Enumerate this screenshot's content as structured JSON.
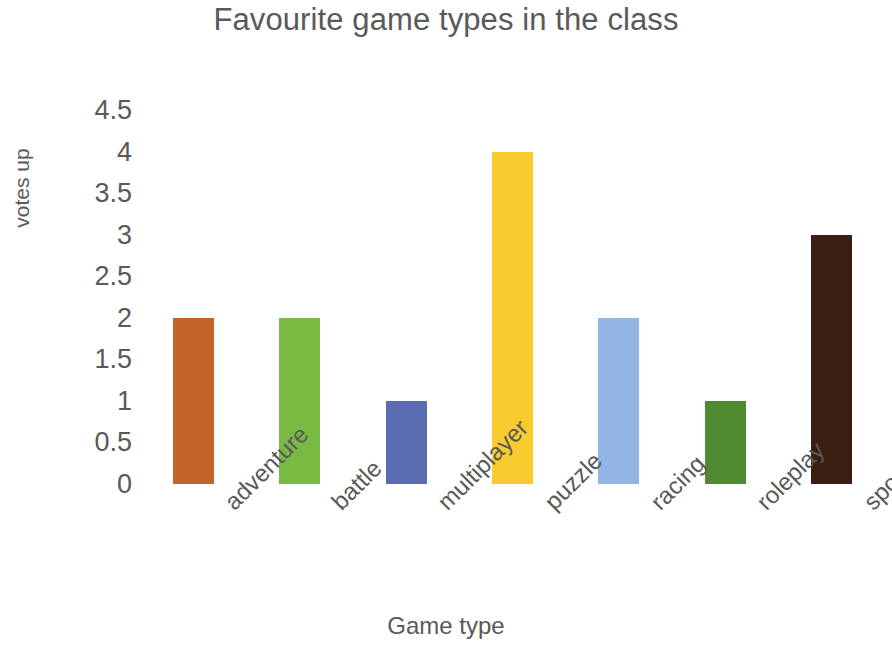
{
  "chart_data": {
    "type": "bar",
    "title": "Favourite game types in the class",
    "xlabel": "Game type",
    "ylabel": "votes up",
    "categories": [
      "adventure",
      "battle",
      "multiplayer",
      "puzzle",
      "racing",
      "roleplay",
      "sports"
    ],
    "values": [
      2,
      2,
      1,
      4,
      2,
      1,
      3
    ],
    "colors": [
      "#C4642A",
      "#79BB42",
      "#5B6BB0",
      "#F8CB2E",
      "#93B5E3",
      "#4F8A31",
      "#3C1D12"
    ],
    "ylim": [
      0,
      4.5
    ],
    "ytick_labels": [
      "4.5",
      "4",
      "3.5",
      "3",
      "2.5",
      "2",
      "1.5",
      "1",
      "0.5",
      "0"
    ],
    "ytick_values": [
      4.5,
      4,
      3.5,
      3,
      2.5,
      2,
      1.5,
      1,
      0.5,
      0
    ],
    "grid": false,
    "legend": "none",
    "background_color": "#FFFFFF",
    "text_color": "#595959"
  }
}
